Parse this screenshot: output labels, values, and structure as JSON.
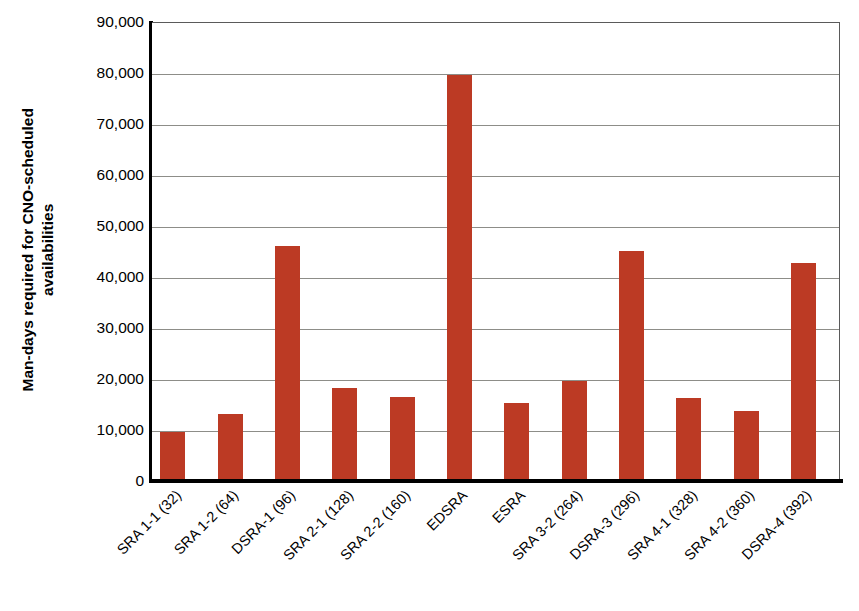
{
  "chart_data": {
    "type": "bar",
    "title": "",
    "xlabel": "",
    "ylabel": "Man-days required for CNO-scheduled availabilities",
    "ylabel_lines": [
      "Man-days required for CNO-scheduled",
      "availabilities"
    ],
    "categories": [
      "SRA 1-1 (32)",
      "SRA 1-2 (64)",
      "DSRA-1 (96)",
      "SRA 2-1 (128)",
      "SRA 2-2 (160)",
      "EDSRA",
      "ESRA",
      "SRA 3-2 (264)",
      "DSRA-3 (296)",
      "SRA 4-1 (328)",
      "SRA 4-2 (360)",
      "DSRA-4 (392)"
    ],
    "values": [
      9700,
      13100,
      46000,
      18200,
      16400,
      79700,
      15200,
      19700,
      45100,
      16300,
      13800,
      42700
    ],
    "ylim": [
      0,
      90000
    ],
    "ytick_values": [
      0,
      10000,
      20000,
      30000,
      40000,
      50000,
      60000,
      70000,
      80000,
      90000
    ],
    "ytick_labels": [
      "0",
      "10,000",
      "20,000",
      "30,000",
      "40,000",
      "50,000",
      "60,000",
      "70,000",
      "80,000",
      "90,000"
    ],
    "grid": true,
    "legend": null,
    "bar_color": "#bc3a24",
    "gridline_color": "#8d8d88",
    "axis_color": "#000000",
    "background_color": "#ffffff"
  }
}
